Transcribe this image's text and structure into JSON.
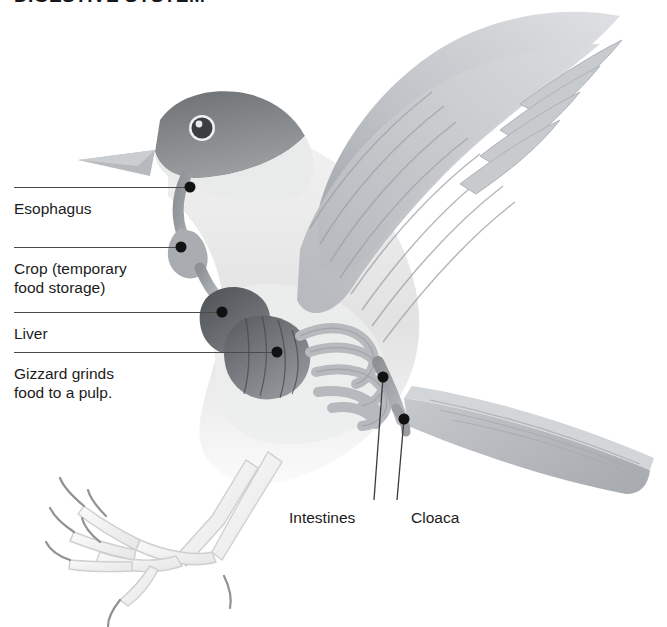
{
  "figure": {
    "title": "DIGESTIVE SYSTEM",
    "style": "grayscale scientific illustration",
    "background_color": "#ffffff",
    "line_color": "#4a4a4a",
    "text_color": "#1b1b1b"
  },
  "labels": [
    {
      "id": "esophagus",
      "text": "Esophagus",
      "line2": ""
    },
    {
      "id": "crop",
      "text": "Crop (temporary",
      "line2": "food storage)"
    },
    {
      "id": "liver",
      "text": "Liver",
      "line2": ""
    },
    {
      "id": "gizzard",
      "text": "Gizzard grinds",
      "line2": "food to a pulp."
    },
    {
      "id": "intestines",
      "text": "Intestines",
      "line2": ""
    },
    {
      "id": "cloaca",
      "text": "Cloaca",
      "line2": ""
    }
  ],
  "illustration": {
    "parts": [
      "head-with-dark-cap",
      "beak",
      "eye",
      "raised-wing-with-flight-feathers",
      "breast",
      "tail-feathers",
      "skeletal-legs-with-talons",
      "esophagus-tube",
      "crop-sac",
      "liver-lobe",
      "gizzard",
      "coiled-intestines",
      "cloaca"
    ]
  }
}
